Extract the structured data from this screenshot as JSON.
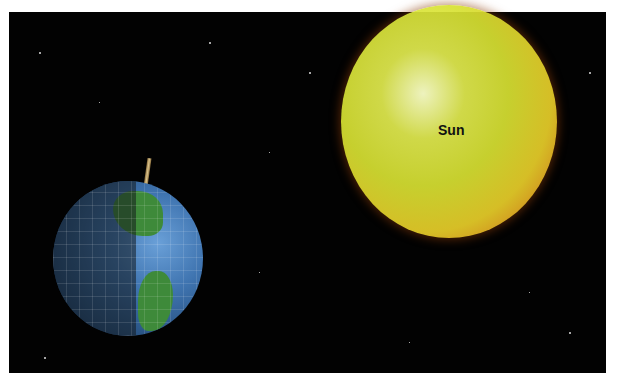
{
  "scene": {
    "background_color": "#020202",
    "sun": {
      "label": "Sun",
      "color": "#e0e83a"
    },
    "earth": {
      "label": ""
    }
  }
}
